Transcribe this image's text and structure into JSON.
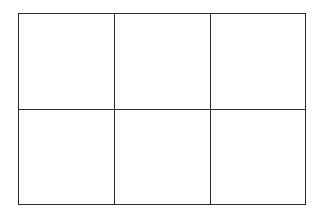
{
  "grid": {
    "rows": 2,
    "cols": 3,
    "line_color": "#2a2a2a",
    "background": "#ffffff",
    "cells": [
      {
        "row": 0,
        "col": 0,
        "label": ""
      },
      {
        "row": 0,
        "col": 1,
        "label": ""
      },
      {
        "row": 0,
        "col": 2,
        "label": ""
      },
      {
        "row": 1,
        "col": 0,
        "label": ""
      },
      {
        "row": 1,
        "col": 1,
        "label": ""
      },
      {
        "row": 1,
        "col": 2,
        "label": ""
      }
    ]
  }
}
